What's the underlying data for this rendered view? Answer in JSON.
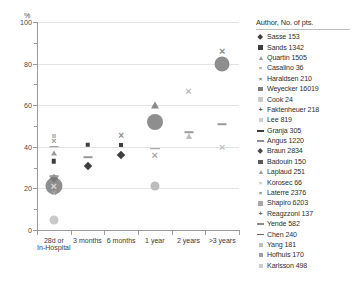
{
  "top_caption": "",
  "axes": {
    "y_unit": "%",
    "y_ticks": [
      "0",
      "20",
      "40",
      "60",
      "80",
      "100"
    ],
    "x_categories": [
      {
        "line1": "28d or",
        "line2": "In-Hospital"
      },
      {
        "line1": "3 months",
        "line2": ""
      },
      {
        "line1": "6 months",
        "line2": ""
      },
      {
        "line1": "1 year",
        "line2": ""
      },
      {
        "line1": "2 years",
        "line2": ""
      },
      {
        "line1": ">3 years",
        "line2": ""
      }
    ]
  },
  "legend": {
    "title": "Author, No. of pts.",
    "items": [
      {
        "label": "Sasse 153",
        "shape": "diamond",
        "color": "#3f3f3f",
        "size": 4.4
      },
      {
        "label": "Sands 1342",
        "shape": "square",
        "color": "#3f3f3f",
        "size": 4.2
      },
      {
        "label": "Quartin 1505",
        "shape": "triangle",
        "color": "#9a9a9a",
        "size": 4.4
      },
      {
        "label": "Casalino 36",
        "shape": "x",
        "color": "#8d8d8d",
        "size": 6
      },
      {
        "label": "Haraldsen 210",
        "shape": "x",
        "color": "#6e6e6e",
        "size": 6
      },
      {
        "label": "Weyecker 16019",
        "shape": "square",
        "color": "#7d7d7d",
        "size": 4.2
      },
      {
        "label": "Cook 24",
        "shape": "square",
        "color": "#c9c9c9",
        "size": 4.2
      },
      {
        "label": "Faktenheuer 218",
        "shape": "plus",
        "color": "#5e5e5e",
        "size": 7
      },
      {
        "label": "Lee 819",
        "shape": "square",
        "color": "#cfcfcf",
        "size": 4
      },
      {
        "label": "Granja 305",
        "shape": "dash",
        "color": "#3f3f3f",
        "size": 7
      },
      {
        "label": "Angus 1220",
        "shape": "dash",
        "color": "#8f8f8f",
        "size": 7
      },
      {
        "label": "Braun 2834",
        "shape": "diamond",
        "color": "#4a4a4a",
        "size": 4.4
      },
      {
        "label": "Badouin 150",
        "shape": "square",
        "color": "#5a5a5a",
        "size": 4.2
      },
      {
        "label": "Laplaud 251",
        "shape": "triangle",
        "color": "#9a9a9a",
        "size": 4.4
      },
      {
        "label": "Korosec 66",
        "shape": "x",
        "color": "#b5b5b5",
        "size": 6
      },
      {
        "label": "Laterre 2376",
        "shape": "x",
        "color": "#6e6e6e",
        "size": 6
      },
      {
        "label": "Shapiro 6203",
        "shape": "square",
        "color": "#a8a8a8",
        "size": 4.2
      },
      {
        "label": "Reagzzoni 137",
        "shape": "plus",
        "color": "#6b6b6b",
        "size": 7
      },
      {
        "label": "Yende 582",
        "shape": "dash",
        "color": "#8a8a8a",
        "size": 7
      },
      {
        "label": "Chen 240",
        "shape": "dash",
        "color": "#6a6a6a",
        "size": 7
      },
      {
        "label": "Yang 181",
        "shape": "square",
        "color": "#bdbdbd",
        "size": 4
      },
      {
        "label": "Hofhuis 170",
        "shape": "square",
        "color": "#9e9e9e",
        "size": 4
      },
      {
        "label": "Karlsson 498",
        "shape": "square",
        "color": "#cccccc",
        "size": 4
      }
    ]
  },
  "chart_data": {
    "type": "scatter",
    "title": "",
    "xlabel": "",
    "ylabel": "%",
    "ylim": [
      0,
      100
    ],
    "grid": true,
    "legend_position": "right",
    "categories": [
      "28d or In-Hospital",
      "3 months",
      "6 months",
      "1 year",
      "2 years",
      ">3 years"
    ],
    "points": [
      {
        "series": "Cook 24",
        "x": 0,
        "y": 5,
        "shape": "circle",
        "color": "#c9c9c9",
        "size": 9
      },
      {
        "series": "Weyecker 16019",
        "x": 0,
        "y": 21,
        "shape": "circle",
        "color": "#8e8e8e",
        "size": 17
      },
      {
        "series": "Casalino 36",
        "x": 0,
        "y": 21,
        "shape": "x",
        "color": "#d8d8d8",
        "size": 11
      },
      {
        "series": "Sasse 153",
        "x": 0,
        "y": 25,
        "shape": "diamond",
        "color": "#787878",
        "size": 5.5
      },
      {
        "series": "Granja 305",
        "x": 0,
        "y": 26,
        "shape": "dash",
        "color": "#9a9a9a",
        "size": 9
      },
      {
        "series": "Haraldsen 210",
        "x": 0,
        "y": 18,
        "shape": "x",
        "color": "#a8a8a8",
        "size": 9
      },
      {
        "series": "Sands 1342",
        "x": 0,
        "y": 33,
        "shape": "square",
        "color": "#3f3f3f",
        "size": 4.5
      },
      {
        "series": "Quartin 1505",
        "x": 0,
        "y": 37,
        "shape": "triangle",
        "color": "#9a9a9a",
        "size": 5
      },
      {
        "series": "Angus 1220",
        "x": 0,
        "y": 40,
        "shape": "dash",
        "color": "#8f8f8f",
        "size": 9
      },
      {
        "series": "Laterre 2376",
        "x": 0,
        "y": 43,
        "shape": "x",
        "color": "#9a9a9a",
        "size": 9
      },
      {
        "series": "Lee 819",
        "x": 0,
        "y": 45,
        "shape": "square",
        "color": "#c4c4c4",
        "size": 4
      },
      {
        "series": "Braun 2834",
        "x": 1,
        "y": 31,
        "shape": "diamond",
        "color": "#3f3f3f",
        "size": 6
      },
      {
        "series": "Yende 582",
        "x": 1,
        "y": 35,
        "shape": "dash",
        "color": "#9a9a9a",
        "size": 9
      },
      {
        "series": "Badouin 150",
        "x": 1,
        "y": 41,
        "shape": "square",
        "color": "#3f3f3f",
        "size": 4.5
      },
      {
        "series": "Sasse 153",
        "x": 2,
        "y": 36,
        "shape": "diamond",
        "color": "#3f3f3f",
        "size": 6
      },
      {
        "series": "Shapiro 6203",
        "x": 2,
        "y": 41,
        "shape": "square",
        "color": "#3f3f3f",
        "size": 4
      },
      {
        "series": "Korosec 66",
        "x": 2,
        "y": 45,
        "shape": "x",
        "color": "#8d8d8d",
        "size": 10
      },
      {
        "series": "Shapiro 6203",
        "x": 3,
        "y": 21,
        "shape": "circle",
        "color": "#bdbdbd",
        "size": 9
      },
      {
        "series": "Laplaud 251",
        "x": 3,
        "y": 36,
        "shape": "x",
        "color": "#a8a8a8",
        "size": 11
      },
      {
        "series": "Chen 240",
        "x": 3,
        "y": 39,
        "shape": "dash",
        "color": "#9a9a9a",
        "size": 10
      },
      {
        "series": "Weyecker 16019",
        "x": 3,
        "y": 52,
        "shape": "circle",
        "color": "#8e8e8e",
        "size": 16
      },
      {
        "series": "Quartin 1505",
        "x": 3,
        "y": 60,
        "shape": "triangle",
        "color": "#8a8a8a",
        "size": 7
      },
      {
        "series": "Laplaud 251",
        "x": 4,
        "y": 45,
        "shape": "triangle",
        "color": "#bdbdbd",
        "size": 6
      },
      {
        "series": "Yang 181",
        "x": 4,
        "y": 47,
        "shape": "dash",
        "color": "#9a9a9a",
        "size": 9
      },
      {
        "series": "Faktenheuer 218",
        "x": 4,
        "y": 67,
        "shape": "x",
        "color": "#bdbdbd",
        "size": 11
      },
      {
        "series": "Hofhuis 170",
        "x": 5,
        "y": 40,
        "shape": "x",
        "color": "#c4c4c4",
        "size": 11
      },
      {
        "series": "Karlsson 498",
        "x": 5,
        "y": 51,
        "shape": "dash",
        "color": "#9a9a9a",
        "size": 9
      },
      {
        "series": "Shapiro 6203",
        "x": 5,
        "y": 80,
        "shape": "circle",
        "color": "#8e8e8e",
        "size": 15
      },
      {
        "series": "Reagzzoni 137",
        "x": 5,
        "y": 86,
        "shape": "x",
        "color": "#8d8d8d",
        "size": 11
      }
    ]
  }
}
